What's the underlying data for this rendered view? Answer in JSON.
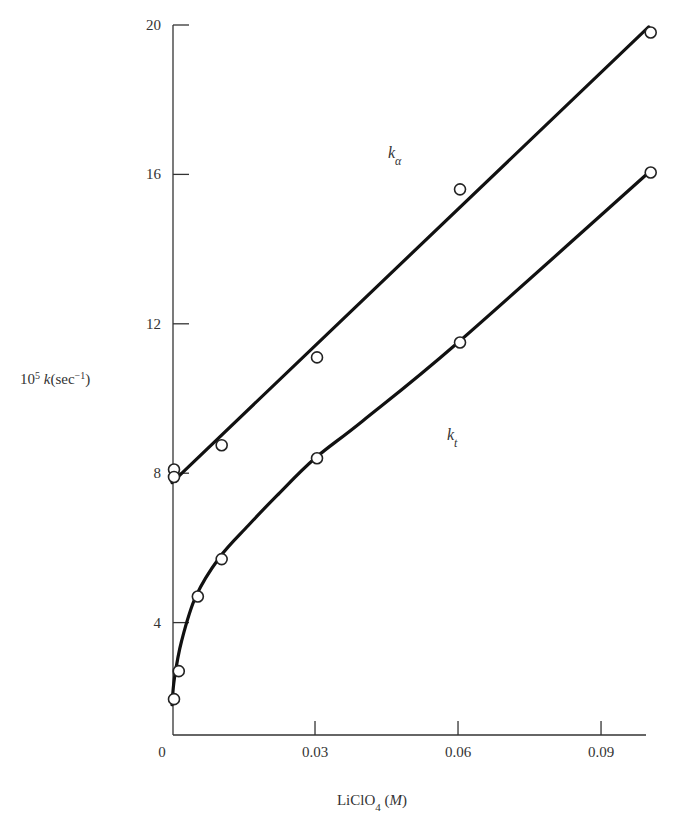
{
  "chart_data": {
    "type": "line",
    "title": "",
    "xlabel": "LiClO4 (M)",
    "ylabel": "10^5 k (sec^-1)",
    "xlim": [
      0,
      0.1
    ],
    "ylim": [
      1,
      20
    ],
    "grid": false,
    "legend": "inline labels",
    "x_ticks": [
      "0",
      "0.03",
      "0.06",
      "0.09"
    ],
    "x_tick_values": [
      0,
      0.03,
      0.06,
      0.09
    ],
    "y_ticks": [
      "4",
      "8",
      "12",
      "16",
      "20"
    ],
    "y_tick_values": [
      4,
      8,
      12,
      16,
      20
    ],
    "series": [
      {
        "name": "kα",
        "label_pos": [
          0.046,
          16.2
        ],
        "marker": "open-circle",
        "points": [
          {
            "x": 0.0,
            "y": 8.1
          },
          {
            "x": 0.0,
            "y": 7.9
          },
          {
            "x": 0.01,
            "y": 8.75
          },
          {
            "x": 0.03,
            "y": 11.1
          },
          {
            "x": 0.06,
            "y": 15.6
          },
          {
            "x": 0.1,
            "y": 19.8
          }
        ],
        "curve": [
          [
            0.0,
            7.75
          ],
          [
            0.1,
            19.95
          ]
        ]
      },
      {
        "name": "kt",
        "label_pos": [
          0.0595,
          8.9
        ],
        "marker": "open-circle",
        "points": [
          {
            "x": 0.0,
            "y": 1.95
          },
          {
            "x": 0.001,
            "y": 2.7
          },
          {
            "x": 0.005,
            "y": 4.7
          },
          {
            "x": 0.01,
            "y": 5.7
          },
          {
            "x": 0.03,
            "y": 8.4
          },
          {
            "x": 0.06,
            "y": 11.5
          },
          {
            "x": 0.1,
            "y": 16.05
          }
        ],
        "curve": [
          [
            0.0,
            1.8
          ],
          [
            0.0005,
            2.5
          ],
          [
            0.002,
            3.5
          ],
          [
            0.005,
            4.7
          ],
          [
            0.01,
            5.75
          ],
          [
            0.016,
            6.6
          ],
          [
            0.022,
            7.4
          ],
          [
            0.03,
            8.4
          ],
          [
            0.04,
            9.4
          ],
          [
            0.06,
            11.5
          ],
          [
            0.1,
            16.05
          ]
        ]
      }
    ]
  },
  "labels": {
    "ylabel_main": "10",
    "ylabel_sup": "5",
    "ylabel_k": "k",
    "ylabel_unit": "(sec",
    "ylabel_unit_sup": "−1",
    "ylabel_close": ")",
    "xlabel_main": "LiClO",
    "xlabel_sub": "4",
    "xlabel_unit": "(M)",
    "k_alpha": "kα",
    "k_t": "kt"
  }
}
